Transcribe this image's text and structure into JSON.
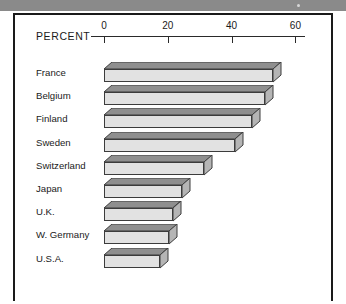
{
  "chart_data": {
    "type": "bar",
    "orientation": "horizontal",
    "title": "",
    "xlabel": "PERCENT",
    "ylabel": "",
    "axis_label": "PERCENT",
    "categories": [
      "France",
      "Belgium",
      "Finland",
      "Sweden",
      "Switzerland",
      "Japan",
      "U.K.",
      "W. Germany",
      "U.S.A."
    ],
    "values": [
      53,
      50.5,
      46.5,
      41,
      31.5,
      24.5,
      21.5,
      20.5,
      17.5
    ],
    "tick_labels": [
      "0",
      "20",
      "40",
      "60"
    ],
    "tick_values": [
      0,
      20,
      40,
      60
    ],
    "xlim": [
      0,
      63
    ],
    "grid": false,
    "legend": null,
    "style": "3d-shaded-horizontal-bars",
    "colors": {
      "bar_front": "#e2e2e2",
      "bar_top": "#8f8f8f",
      "bar_side": "#b5b5b5",
      "bar_outline": "#3c3c3c",
      "axis": "#2a2a2a",
      "frame": "#1a1a1a",
      "text": "#1a1a1a",
      "page_band": "#8a8a8a"
    }
  },
  "axis": {
    "label": "PERCENT",
    "ticks": [
      {
        "label": "0",
        "value": 0
      },
      {
        "label": "20",
        "value": 20
      },
      {
        "label": "40",
        "value": 40
      },
      {
        "label": "60",
        "value": 60
      }
    ]
  },
  "bars": [
    {
      "label": "France",
      "value": 53
    },
    {
      "label": "Belgium",
      "value": 50.5
    },
    {
      "label": "Finland",
      "value": 46.5
    },
    {
      "label": "Sweden",
      "value": 41
    },
    {
      "label": "Switzerland",
      "value": 31.5
    },
    {
      "label": "Japan",
      "value": 24.5
    },
    {
      "label": "U.K.",
      "value": 21.5
    },
    {
      "label": "W. Germany",
      "value": 20.5
    },
    {
      "label": "U.S.A.",
      "value": 17.5
    }
  ]
}
